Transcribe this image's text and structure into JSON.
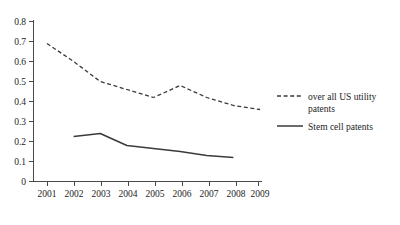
{
  "chart_data": {
    "type": "line",
    "title": "",
    "subtitle": "",
    "xlabel": "",
    "ylabel": "",
    "x": [
      2001,
      2002,
      2003,
      2004,
      2005,
      2006,
      2007,
      2008,
      2009
    ],
    "xtick_labels": [
      "2001",
      "2002",
      "2003",
      "2004",
      "2005",
      "2006",
      "2007",
      "2008",
      "2009"
    ],
    "ytick_labels": [
      "0",
      "0.1",
      "0.2",
      "0.3",
      "0.4",
      "0.5",
      "0.6",
      "0.7",
      "0.8"
    ],
    "ytick_values": [
      0,
      0.1,
      0.2,
      0.3,
      0.4,
      0.5,
      0.6,
      0.7,
      0.8
    ],
    "ylim": [
      0,
      0.8
    ],
    "xlim": [
      2001,
      2009
    ],
    "grid": false,
    "legend_position": "right",
    "series": [
      {
        "name": "over all US utility patents",
        "style": "dashed",
        "color": "#3a3a3a",
        "x": [
          2001,
          2002,
          2003,
          2004,
          2005,
          2006,
          2007,
          2008,
          2009
        ],
        "values": [
          0.69,
          0.6,
          0.5,
          0.46,
          0.42,
          0.48,
          0.42,
          0.38,
          0.36
        ]
      },
      {
        "name": "Stem cell patents",
        "style": "solid",
        "color": "#3a3a3a",
        "x": [
          2002,
          2003,
          2004,
          2005,
          2006,
          2007,
          2008
        ],
        "values": [
          0.225,
          0.24,
          0.18,
          0.165,
          0.15,
          0.13,
          0.12
        ]
      }
    ]
  },
  "legend": {
    "entries": [
      {
        "label_line1": "over all US utility",
        "label_line2": "patents",
        "style": "dashed"
      },
      {
        "label_line1": "Stem cell patents",
        "label_line2": "",
        "style": "solid"
      }
    ]
  }
}
